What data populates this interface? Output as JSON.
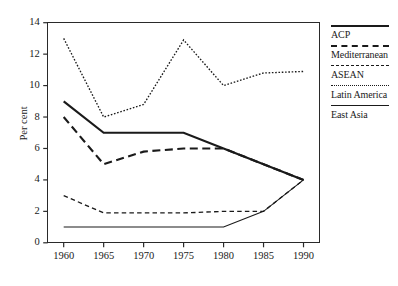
{
  "chart_data": {
    "type": "line",
    "title": "",
    "xlabel": "",
    "ylabel": "Per cent",
    "x": [
      1960,
      1965,
      1970,
      1975,
      1980,
      1985,
      1990
    ],
    "xtick_labels": [
      "1960",
      "1965",
      "1970",
      "1975",
      "1980",
      "1985",
      "1990"
    ],
    "ytick_labels": [
      "0",
      "2",
      "4",
      "6",
      "8",
      "10",
      "12",
      "14"
    ],
    "yticks": [
      0,
      2,
      4,
      6,
      8,
      10,
      12,
      14
    ],
    "ylim": [
      0,
      14
    ],
    "xlim": [
      1958,
      1992
    ],
    "grid": false,
    "legend_position": "right",
    "series": [
      {
        "name": "ACP",
        "style": "solid-thick",
        "color": "#1a1a1a",
        "values": [
          9.0,
          7.0,
          7.0,
          7.0,
          6.0,
          5.0,
          4.0
        ]
      },
      {
        "name": "Mediterranean",
        "style": "longdash",
        "color": "#1a1a1a",
        "values": [
          8.0,
          5.0,
          5.8,
          6.0,
          6.0,
          5.0,
          4.0
        ]
      },
      {
        "name": "ASEAN",
        "style": "shortdash",
        "color": "#1a1a1a",
        "values": [
          3.0,
          1.9,
          1.9,
          1.9,
          2.0,
          2.0,
          4.0
        ]
      },
      {
        "name": "Latin America",
        "style": "dotted",
        "color": "#1a1a1a",
        "values": [
          13.0,
          8.0,
          8.8,
          12.9,
          10.0,
          10.8,
          10.9
        ]
      },
      {
        "name": "East Asia",
        "style": "solid-thin",
        "color": "#1a1a1a",
        "values": [
          1.0,
          1.0,
          1.0,
          1.0,
          1.0,
          2.0,
          4.0
        ]
      }
    ]
  },
  "legend": {
    "entries": [
      {
        "label": "ACP",
        "style": "solid-thick"
      },
      {
        "label": "Mediterranean",
        "style": "longdash"
      },
      {
        "label": "ASEAN",
        "style": "shortdash"
      },
      {
        "label": "Latin America",
        "style": "dotted"
      },
      {
        "label": "East Asia",
        "style": "solid-thin"
      }
    ]
  }
}
